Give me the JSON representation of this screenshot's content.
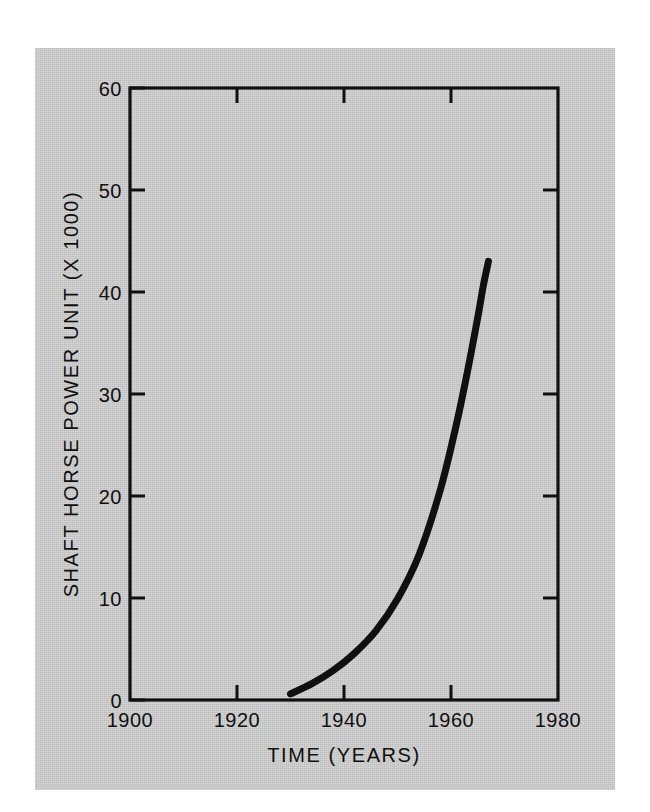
{
  "figure": {
    "background_color": "#ffffff",
    "panel_color": "#cbcbcb",
    "ink_color": "#101010"
  },
  "chart_data": {
    "type": "line",
    "title": "",
    "subtitle": "",
    "xlabel": "TIME  (YEARS)",
    "ylabel": "SHAFT HORSE POWER UNIT (X 1000)",
    "xlim": [
      1900,
      1980
    ],
    "ylim": [
      0,
      60
    ],
    "xticks": [
      1900,
      1920,
      1940,
      1960,
      1980
    ],
    "xticklabels": [
      "1900",
      "1920",
      "1940",
      "1960",
      "1980"
    ],
    "yticks": [
      0,
      10,
      20,
      30,
      40,
      50,
      60
    ],
    "yticklabels": [
      "0",
      "10",
      "20",
      "30",
      "40",
      "50",
      "60"
    ],
    "grid": false,
    "legend": false,
    "legend_position": "none",
    "series": [
      {
        "name": "Shaft horse power per unit",
        "line_color": "#101010",
        "line_width_px": 7,
        "x": [
          1930,
          1934,
          1938,
          1942,
          1946,
          1950,
          1954,
          1958,
          1961,
          1963,
          1965,
          1966,
          1967
        ],
        "y": [
          0.6,
          1.6,
          2.9,
          4.6,
          6.8,
          9.9,
          14.2,
          20.6,
          27.0,
          32.0,
          37.5,
          40.5,
          43.0
        ]
      }
    ],
    "annotations": []
  },
  "axis_labels": {
    "x_title": "TIME  (YEARS)",
    "y_title": "SHAFT HORSE POWER UNIT (X 1000)",
    "x_ticks": [
      "1900",
      "1920",
      "1940",
      "1960",
      "1980"
    ],
    "y_ticks": [
      "0",
      "10",
      "20",
      "30",
      "40",
      "50",
      "60"
    ]
  }
}
